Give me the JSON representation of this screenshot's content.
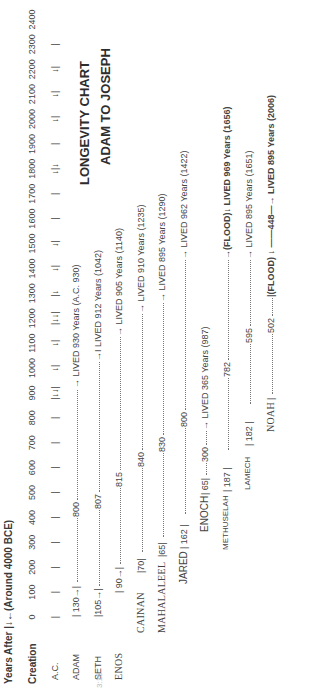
{
  "header": {
    "years_after_label": "Years  After |↓←(Around 4000 BCE)",
    "creation_label": "Creation",
    "ac_label": "A.C."
  },
  "title": {
    "line1": "LONGEVITY CHART",
    "line2": "ADAM TO JOSEPH"
  },
  "scale": {
    "ticks": [
      "0",
      "100",
      "200",
      "300",
      "400",
      "500",
      "600",
      "700",
      "800",
      "900",
      "1000",
      "1100",
      "1200",
      "1300",
      "1400",
      "1500",
      "1600",
      "1700",
      "1800",
      "1900",
      "2000",
      "2100",
      "2200",
      "2300",
      "2400"
    ],
    "ac_marks": [
      "|",
      "|",
      "|",
      "|",
      "|",
      "|",
      "|",
      "|",
      "|",
      "|↓↓|",
      "↓|",
      "↓|",
      "|↓↓|",
      "|↓",
      "↓|",
      "↓|",
      "|",
      "|",
      "↓|↓",
      "|",
      "↓|",
      "↓|",
      "↓|",
      "|"
    ]
  },
  "patriarchs": [
    {
      "name": "ADAM",
      "birth": 0,
      "begat_age": 130,
      "begat_label": "| 130→|",
      "after": "800",
      "lived": 930,
      "death_year": 930,
      "result": "→ LIVED 930 Years (A.C. 930)"
    },
    {
      "name": "SETH",
      "birth": 130,
      "begat_age": 105,
      "begat_label": "|105→|",
      "after": "807",
      "lived": 912,
      "death_year": 1042,
      "result": "→I LIVED 912 Years (1042)"
    },
    {
      "name": "ENOS",
      "birth": 235,
      "begat_age": 90,
      "begat_label": "| 90→|",
      "after": "815",
      "lived": 905,
      "death_year": 1140,
      "result": "→ LIVED 905 Years (1140)"
    },
    {
      "name": "CAINAN",
      "birth": 325,
      "begat_age": 70,
      "begat_label": "|70|",
      "after": "840",
      "lived": 910,
      "death_year": 1235,
      "result": "→ LIVED 910 Years (1235)"
    },
    {
      "name": "MAHALALEEL",
      "birth": 395,
      "begat_age": 65,
      "begat_label": "|65|",
      "after": "830",
      "lived": 895,
      "death_year": 1290,
      "result": "→ LIVED 895 Years (1290)"
    },
    {
      "name": "JARED",
      "birth": 460,
      "begat_age": 162,
      "begat_label": "|  162 |",
      "after": "800",
      "lived": 962,
      "death_year": 1422,
      "result": "→ LIVED 962 Years (1422)"
    },
    {
      "name": "ENOCH",
      "birth": 622,
      "begat_age": 65,
      "begat_label": "| 65|",
      "after": "300",
      "lived": 365,
      "death_year": 987,
      "result": "→ LIVED 365 Years (987)"
    },
    {
      "name": "METHUSELAH",
      "birth": 687,
      "begat_age": 187,
      "begat_label": "|  187  |",
      "after": "782",
      "lived": 969,
      "death_year": 1656,
      "result": "→(FLOOD)↓ LIVED 969 Years (1656)"
    },
    {
      "name": "LAMECH",
      "birth": 874,
      "begat_age": 182,
      "begat_label": "|  182  |",
      "after": "595",
      "lived": 777,
      "death_year": 1651,
      "result": "→ LIVED 895 Years (1651)"
    },
    {
      "name": "NOAH",
      "birth": 1056,
      "begat_age": null,
      "begat_label": "|",
      "after": "502",
      "lived": 950,
      "death_year": 2006,
      "result": "|(FLOOD) ↓ ——448—→ LIVED 895 Years (2006)"
    }
  ],
  "footer": {
    "clipped_text": "3:16"
  },
  "chart_data": {
    "type": "table",
    "xlabel": "Years After Creation (Around 4000 BCE)",
    "ylabel": "",
    "xlim": [
      0,
      2400
    ],
    "x_ticks": [
      0,
      100,
      200,
      300,
      400,
      500,
      600,
      700,
      800,
      900,
      1000,
      1100,
      1200,
      1300,
      1400,
      1500,
      1600,
      1700,
      1800,
      1900,
      2000,
      2100,
      2200,
      2300,
      2400
    ],
    "grid": false,
    "legend": "none",
    "categories": [
      "ADAM",
      "SETH",
      "ENOS",
      "CAINAN",
      "MAHALALEEL",
      "JARED",
      "ENOCH",
      "METHUSELAH",
      "LAMECH",
      "NOAH"
    ],
    "series": [
      {
        "name": "Age at son's birth",
        "values": [
          130,
          105,
          90,
          70,
          65,
          162,
          65,
          187,
          182,
          502
        ]
      },
      {
        "name": "Years lived after",
        "values": [
          800,
          807,
          815,
          840,
          830,
          800,
          300,
          782,
          595,
          448
        ]
      },
      {
        "name": "Lifespan (years)",
        "values": [
          930,
          912,
          905,
          910,
          895,
          962,
          365,
          969,
          895,
          895
        ]
      },
      {
        "name": "Year of death (A.C.)",
        "values": [
          930,
          1042,
          1140,
          1235,
          1290,
          1422,
          987,
          1656,
          1651,
          2006
        ]
      }
    ],
    "annotations": [
      "(FLOOD) at 1656 A.C.",
      "LIVED 930 Years (A.C. 930)"
    ]
  }
}
